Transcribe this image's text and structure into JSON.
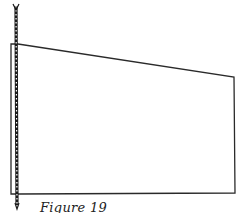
{
  "figure": {
    "caption": "Figure 19",
    "colors": {
      "line": "#2a2a2a",
      "rope": "#1a1a1a",
      "background": "#ffffff"
    }
  }
}
